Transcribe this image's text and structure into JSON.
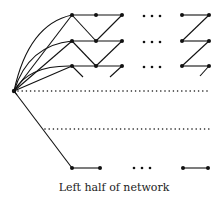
{
  "caption": "Left half of network",
  "colors": {
    "stroke": "#111111",
    "background": "#ffffff"
  },
  "hub": {
    "x": 14,
    "y": 91
  },
  "rows": [
    {
      "y": 15,
      "nodes": [
        72,
        96,
        122
      ],
      "right_nodes": [
        182,
        209
      ]
    },
    {
      "y": 41,
      "nodes": [
        72,
        96,
        122
      ],
      "right_nodes": [
        182,
        209
      ]
    },
    {
      "y": 66,
      "nodes": [
        72,
        96,
        122
      ],
      "right_nodes": [
        182,
        209
      ]
    }
  ],
  "ellipsis_x": [
    144,
    152,
    160
  ],
  "dotted_lines": [
    {
      "y": 91,
      "x1": 18,
      "x2": 210
    },
    {
      "y": 129,
      "x1": 45,
      "x2": 210
    }
  ],
  "bottom_row": {
    "y": 168,
    "left_nodes": [
      72,
      100
    ],
    "ellipsis_x": [
      134,
      142,
      150
    ],
    "right_nodes": [
      183,
      208
    ]
  }
}
